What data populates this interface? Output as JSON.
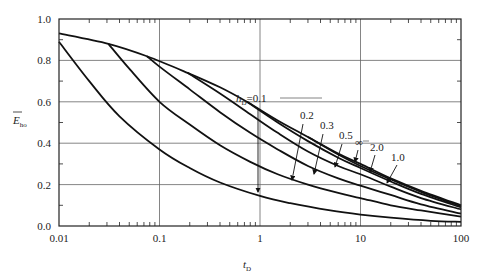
{
  "chart_data": {
    "type": "line",
    "title": "",
    "xlabel": "t",
    "xlabel_subscript": "D",
    "ylabel": "E",
    "ylabel_subscript": "ho",
    "ylabel_overbar": true,
    "xscale": "log",
    "xlim": [
      0.01,
      100
    ],
    "ylim": [
      0.0,
      1.0
    ],
    "grid": true,
    "x_ticks": [
      {
        "value": 0.01,
        "label": "0.01"
      },
      {
        "value": 0.1,
        "label": "0.1"
      },
      {
        "value": 1,
        "label": "1"
      },
      {
        "value": 10,
        "label": "10"
      },
      {
        "value": 100,
        "label": "100"
      }
    ],
    "y_ticks": [
      {
        "value": 0.0,
        "label": "0.0"
      },
      {
        "value": 0.2,
        "label": "0.2"
      },
      {
        "value": 0.4,
        "label": "0.4"
      },
      {
        "value": 0.6,
        "label": "0.6"
      },
      {
        "value": 0.8,
        "label": "0.8"
      },
      {
        "value": 1.0,
        "label": "1.0"
      }
    ],
    "y_minor_ticks": [
      0.1,
      0.3,
      0.5,
      0.7,
      0.9
    ],
    "series": [
      {
        "name": "h_D=∞",
        "label": "∞",
        "points": [
          [
            0.01,
            0.93
          ],
          [
            0.031,
            0.88
          ],
          [
            0.075,
            0.82
          ],
          [
            0.19,
            0.74
          ],
          [
            0.4,
            0.67
          ],
          [
            0.74,
            0.6
          ],
          [
            1.5,
            0.51
          ],
          [
            3.0,
            0.43
          ],
          [
            6,
            0.35
          ],
          [
            10,
            0.3
          ],
          [
            20,
            0.23
          ],
          [
            40,
            0.17
          ],
          [
            100,
            0.1
          ]
        ]
      },
      {
        "name": "h_D=2.0",
        "label": "2.0",
        "points": [
          [
            3.0,
            0.43
          ],
          [
            6,
            0.345
          ],
          [
            10,
            0.29
          ],
          [
            20,
            0.225
          ],
          [
            40,
            0.165
          ],
          [
            100,
            0.095
          ]
        ]
      },
      {
        "name": "h_D=1.0",
        "label": "1.0",
        "points": [
          [
            0.74,
            0.6
          ],
          [
            1.5,
            0.5
          ],
          [
            3.0,
            0.41
          ],
          [
            6,
            0.33
          ],
          [
            10,
            0.28
          ],
          [
            20,
            0.215
          ],
          [
            40,
            0.155
          ],
          [
            100,
            0.09
          ]
        ]
      },
      {
        "name": "h_D=0.5",
        "label": "0.5",
        "points": [
          [
            0.19,
            0.74
          ],
          [
            0.4,
            0.64
          ],
          [
            0.8,
            0.54
          ],
          [
            1.5,
            0.45
          ],
          [
            3,
            0.36
          ],
          [
            6,
            0.29
          ],
          [
            10,
            0.25
          ],
          [
            20,
            0.19
          ],
          [
            40,
            0.135
          ],
          [
            100,
            0.08
          ]
        ]
      },
      {
        "name": "h_D=0.3",
        "label": "0.3",
        "points": [
          [
            0.075,
            0.82
          ],
          [
            0.1,
            0.77
          ],
          [
            0.2,
            0.66
          ],
          [
            0.4,
            0.55
          ],
          [
            0.8,
            0.45
          ],
          [
            1.5,
            0.37
          ],
          [
            3,
            0.29
          ],
          [
            6,
            0.23
          ],
          [
            10,
            0.195
          ],
          [
            20,
            0.15
          ],
          [
            40,
            0.105
          ],
          [
            100,
            0.06
          ]
        ]
      },
      {
        "name": "h_D=0.2",
        "label": "0.2",
        "points": [
          [
            0.031,
            0.88
          ],
          [
            0.05,
            0.76
          ],
          [
            0.1,
            0.6
          ],
          [
            0.2,
            0.49
          ],
          [
            0.4,
            0.39
          ],
          [
            0.8,
            0.31
          ],
          [
            1.5,
            0.25
          ],
          [
            3,
            0.2
          ],
          [
            6,
            0.16
          ],
          [
            10,
            0.135
          ],
          [
            20,
            0.1
          ],
          [
            40,
            0.075
          ],
          [
            100,
            0.045
          ]
        ]
      },
      {
        "name": "h_D=0.1",
        "label": "h_D=0.1",
        "points": [
          [
            0.01,
            0.89
          ],
          [
            0.02,
            0.7
          ],
          [
            0.04,
            0.53
          ],
          [
            0.1,
            0.37
          ],
          [
            0.2,
            0.28
          ],
          [
            0.4,
            0.21
          ],
          [
            1,
            0.145
          ],
          [
            2,
            0.11
          ],
          [
            5,
            0.075
          ],
          [
            10,
            0.055
          ],
          [
            20,
            0.04
          ],
          [
            50,
            0.025
          ],
          [
            100,
            0.02
          ]
        ]
      }
    ],
    "annotations": [
      {
        "text": "h",
        "subscript": "D",
        "suffix": "=0.1",
        "points_to_series": "h_D=0.1"
      },
      {
        "text": "0.2",
        "points_to_series": "h_D=0.2"
      },
      {
        "text": "0.3",
        "points_to_series": "h_D=0.3"
      },
      {
        "text": "0.5",
        "points_to_series": "h_D=0.5"
      },
      {
        "text": "∞",
        "points_to_series": "h_D=∞"
      },
      {
        "text": "2.0",
        "points_to_series": "h_D=2.0"
      },
      {
        "text": "1.0",
        "points_to_series": "h_D=1.0"
      }
    ]
  }
}
